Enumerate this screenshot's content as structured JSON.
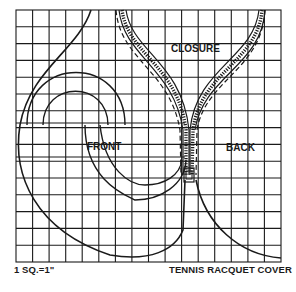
{
  "diagram": {
    "title": "TENNIS RACQUET COVER",
    "scale_label": "1 SQ.=1\"",
    "grid": {
      "columns": 16,
      "rows": 15,
      "square_size": "1\""
    },
    "pieces": [
      {
        "label": "FRONT"
      },
      {
        "label": "BACK"
      }
    ],
    "closure_label": "CLOSURE",
    "colors": {
      "ink": "#1a1a1a",
      "paper": "#ffffff"
    }
  }
}
